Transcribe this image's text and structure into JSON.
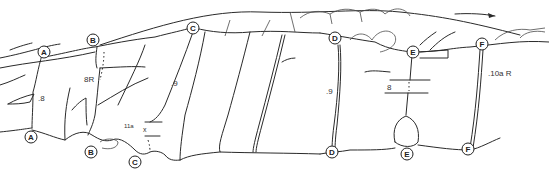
{
  "diagram": {
    "type": "climbing-topo",
    "routes": [
      {
        "id": "A",
        "grade": ".8"
      },
      {
        "id": "B",
        "grade": "8R"
      },
      {
        "id": "C",
        "grade": ".9",
        "variation_grade": "11a"
      },
      {
        "id": "D",
        "grade": ".9"
      },
      {
        "id": "E",
        "grade": "8"
      },
      {
        "id": "F",
        "grade": ".10a R"
      }
    ],
    "markers": {
      "top": [
        "A",
        "B",
        "C",
        "D",
        "E",
        "F"
      ],
      "bottom": [
        "A",
        "B",
        "C",
        "D",
        "E",
        "F"
      ]
    },
    "labels": {
      "a_top": "A",
      "a_bot": "A",
      "b_top": "B",
      "b_bot": "B",
      "c_top": "C",
      "c_bot": "C",
      "d_top": "D",
      "d_bot": "D",
      "e_top": "E",
      "e_bot": "E",
      "f_top": "F",
      "f_bot": "F",
      "grade_a": ".8",
      "grade_b": "8R",
      "grade_c": ".9",
      "grade_c_var": "11a",
      "grade_c_x": "x",
      "grade_d": ".9",
      "grade_e": "8",
      "grade_f": ".10a R"
    },
    "arrow": {
      "direction": "right"
    }
  }
}
